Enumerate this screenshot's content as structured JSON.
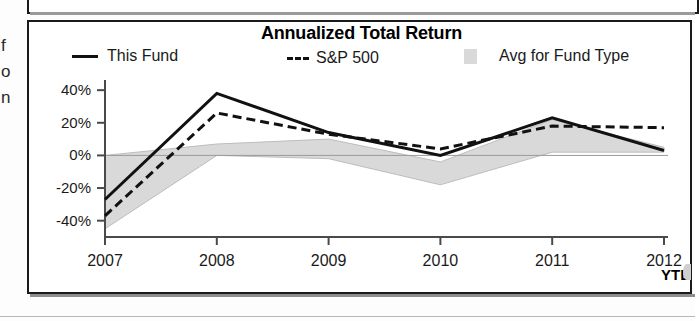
{
  "chart_data": {
    "type": "line",
    "title": "Annualized Total Return",
    "xlabel": "",
    "ylabel": "",
    "categories": [
      "2007",
      "2008",
      "2009",
      "2010",
      "2011",
      "2012"
    ],
    "x_tick_suffix": "YTD",
    "y_ticks": [
      "-40%",
      "-20%",
      "0%",
      "20%",
      "40%"
    ],
    "y_tick_values": [
      -40,
      -20,
      0,
      20,
      40
    ],
    "ylim": [
      -50,
      45
    ],
    "grid": false,
    "legend_position": "top",
    "series": [
      {
        "name": "This Fund",
        "style": "solid",
        "color": "#111111",
        "values": [
          -27,
          38,
          14,
          0,
          23,
          3
        ]
      },
      {
        "name": "S&P 500",
        "style": "dashed",
        "color": "#111111",
        "values": [
          -37,
          26,
          13,
          4,
          18,
          17
        ]
      },
      {
        "name": "Avg for Fund Type",
        "style": "band",
        "color": "#d9d9d9",
        "upper": [
          0,
          7,
          10,
          -4,
          22,
          5
        ],
        "lower": [
          -45,
          0,
          -2,
          -18,
          2,
          2
        ]
      }
    ],
    "legend": [
      {
        "label": "This Fund",
        "swatch": "solid-line"
      },
      {
        "label": "S&P 500",
        "swatch": "dashed-line"
      },
      {
        "label": "Avg for Fund Type",
        "swatch": "gray-area"
      }
    ]
  },
  "side_text_fragments": [
    "f",
    "o",
    "n"
  ],
  "colors": {
    "line": "#111111",
    "band": "#d9d9d9",
    "axis": "#555555",
    "panel_border": "#1a1a1a"
  }
}
